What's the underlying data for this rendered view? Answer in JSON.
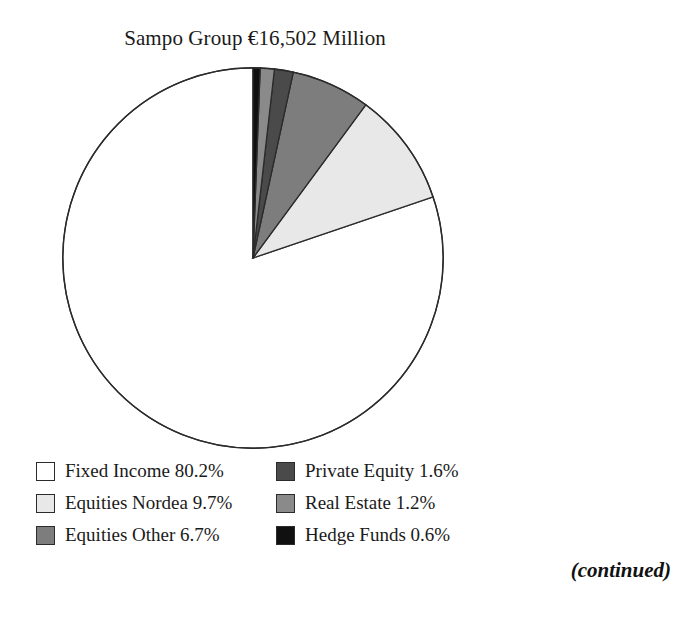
{
  "title": "Sampo Group €16,502 Million",
  "continued_note": "(continued)",
  "legend": {
    "items": [
      {
        "label": "Fixed Income 80.2%",
        "color": "#ffffff"
      },
      {
        "label": "Private Equity 1.6%",
        "color": "#4a4a4a"
      },
      {
        "label": "Equities Nordea 9.7%",
        "color": "#e8e8e8"
      },
      {
        "label": "Real Estate 1.2%",
        "color": "#8a8a8a"
      },
      {
        "label": "Equities Other 6.7%",
        "color": "#7d7d7d"
      },
      {
        "label": "Hedge Funds 0.6%",
        "color": "#101010"
      }
    ]
  },
  "chart_data": {
    "type": "pie",
    "title": "Sampo Group €16,502 Million",
    "total_label": "€16,502 Million",
    "total_value": 16502,
    "units": "EUR million",
    "start_angle_deg": 90,
    "direction": "counterclockwise",
    "legend_position": "bottom",
    "grid": false,
    "categories": [
      "Fixed Income",
      "Equities Nordea",
      "Equities Other",
      "Private Equity",
      "Real Estate",
      "Hedge Funds"
    ],
    "values": [
      80.2,
      9.7,
      6.7,
      1.6,
      1.2,
      0.6
    ],
    "value_labels": [
      "80.2%",
      "9.7%",
      "6.7%",
      "1.6%",
      "1.2%",
      "0.6%"
    ],
    "colors": [
      "#ffffff",
      "#e8e8e8",
      "#7d7d7d",
      "#4a4a4a",
      "#8a8a8a",
      "#101010"
    ],
    "slice_border_color": "#2b2b2b",
    "slices": [
      {
        "name": "Fixed Income",
        "percent": 80.2,
        "color": "#ffffff"
      },
      {
        "name": "Equities Nordea",
        "percent": 9.7,
        "color": "#e8e8e8"
      },
      {
        "name": "Equities Other",
        "percent": 6.7,
        "color": "#7d7d7d"
      },
      {
        "name": "Private Equity",
        "percent": 1.6,
        "color": "#4a4a4a"
      },
      {
        "name": "Real Estate",
        "percent": 1.2,
        "color": "#8a8a8a"
      },
      {
        "name": "Hedge Funds",
        "percent": 0.6,
        "color": "#101010"
      }
    ]
  }
}
